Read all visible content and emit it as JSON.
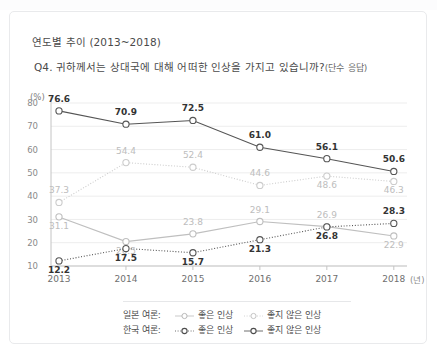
{
  "card": {
    "title": "연도별 추이 (2013~2018)",
    "question_main": "Q4. 귀하께서는 상대국에 대해 어떠한 인상을 가지고 있습니까?",
    "question_sub": "(단수 응답)",
    "unit_label": "(%)",
    "xaxis_unit": "(년)"
  },
  "legend": {
    "row1_name": "일본 여론:",
    "row2_name": "한국 여론:",
    "good_label": "좋은 인상",
    "bad_label": "좋지 않은 인상"
  },
  "colors": {
    "dark": "#555555",
    "light": "#c9c9c9",
    "mid": "#9b9b9b",
    "grid": "#ededed",
    "axis": "#c4c4c4",
    "label_dark": "#333333",
    "label_light": "#bdbdbd",
    "card_border": "#e9eaec"
  },
  "chart_data": {
    "type": "line",
    "title": "연도별 추이 (2013~2018)",
    "subtitle": "Q4. 귀하께서는 상대국에 대해 어떠한 인상을 가지고 있습니까?(단수 응답)",
    "xlabel": "(년)",
    "ylabel": "(%)",
    "ylim": [
      10,
      80
    ],
    "yticks": [
      10,
      20,
      30,
      40,
      50,
      60,
      70,
      80
    ],
    "grid": true,
    "legend_position": "bottom",
    "categories": [
      "2013",
      "2014",
      "2015",
      "2016",
      "2017",
      "2018"
    ],
    "series": [
      {
        "name": "한국 여론: 좋지 않은 인상",
        "group": "한국 여론",
        "kind": "좋지 않은 인상",
        "style": "solid",
        "color": "#555555",
        "label_color": "#333333",
        "values": [
          76.6,
          70.9,
          72.5,
          61.0,
          56.1,
          50.6
        ]
      },
      {
        "name": "일본 여론: 좋지 않은 인상",
        "group": "일본 여론",
        "kind": "좋지 않은 인상",
        "style": "dotted",
        "color": "#cccccc",
        "label_color": "#bdbdbd",
        "values": [
          37.3,
          54.4,
          52.4,
          44.6,
          48.6,
          46.3
        ]
      },
      {
        "name": "일본 여론: 좋은 인상",
        "group": "일본 여론",
        "kind": "좋은 인상",
        "style": "solid",
        "color": "#bfbfbf",
        "label_color": "#bdbdbd",
        "values": [
          31.1,
          20.5,
          23.8,
          29.1,
          26.9,
          22.9
        ]
      },
      {
        "name": "한국 여론: 좋은 인상",
        "group": "한국 여론",
        "kind": "좋은 인상",
        "style": "dotted",
        "color": "#555555",
        "label_color": "#333333",
        "values": [
          12.2,
          17.5,
          15.7,
          21.3,
          26.8,
          28.3
        ]
      }
    ]
  }
}
